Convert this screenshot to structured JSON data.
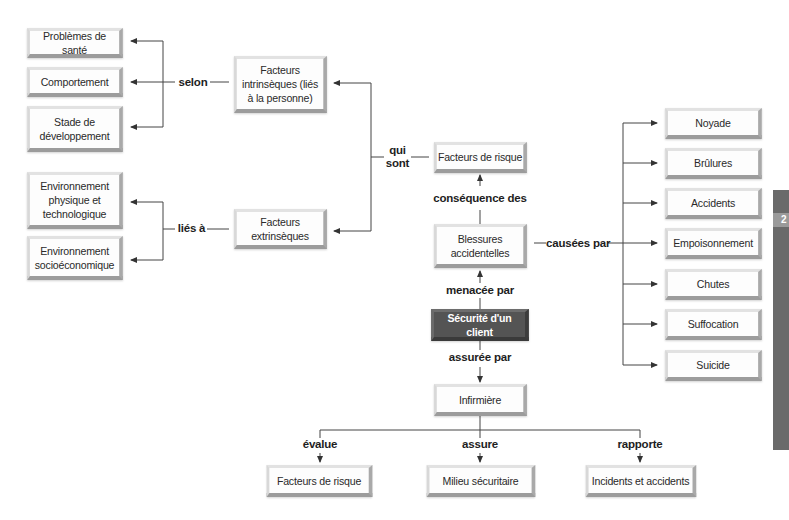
{
  "diagram": {
    "central": "Sécurité d'un client",
    "nodes": {
      "facteurs_risque_top": "Facteurs de risque",
      "blessures": [
        "Blessures",
        "accidentelles"
      ],
      "intrinseques": [
        "Facteurs",
        "intrinsèques (liés",
        "à la personne)"
      ],
      "extrinseques": [
        "Facteurs",
        "extrinsèques"
      ],
      "infirmiere": "Infirmière",
      "sante": "Problèmes de santé",
      "comportement": "Comportement",
      "stade": [
        "Stade de",
        "développement"
      ],
      "env_physique": [
        "Environnement",
        "physique et",
        "technologique"
      ],
      "env_socio": [
        "Environnement",
        "socioéconomique"
      ],
      "causes": [
        "Noyade",
        "Brûlures",
        "Accidents",
        "Empoisonnement",
        "Chutes",
        "Suffocation",
        "Suicide"
      ],
      "bottom": [
        "Facteurs de risque",
        "Milieu sécuritaire",
        "Incidents et accidents"
      ]
    },
    "links": {
      "menacee_par": "menacée par",
      "consequence_des": "conséquence des",
      "qui_sont": [
        "qui",
        "sont"
      ],
      "selon": "selon",
      "lies_a": "liés à",
      "causees_par": "causées par",
      "assuree_par": "assurée par",
      "evalue": "évalue",
      "assure": "assure",
      "rapporte": "rapporte"
    },
    "colors": {
      "central_fill": "#545454",
      "box_fill": "#fdfdfd",
      "box_bevel": "#a9a9a9",
      "line": "#333333",
      "side_tab": "#6a6a6a"
    },
    "side_tab_glyph": "2"
  }
}
